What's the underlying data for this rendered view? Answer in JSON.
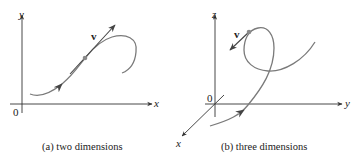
{
  "panel_a": {
    "caption": "(a)  two dimensions",
    "axis_labels": {
      "x": "x",
      "y": "y",
      "origin": "0"
    },
    "vector_label": "v"
  },
  "panel_b": {
    "caption": "(b)  three dimensions",
    "axis_labels": {
      "x": "x",
      "y": "y",
      "z": "z",
      "origin": "0"
    },
    "vector_label": "v"
  },
  "colors": {
    "axes": "#333333",
    "curve": "#7a7a7a",
    "vector": "#444444",
    "point": "#8a8a8a"
  }
}
